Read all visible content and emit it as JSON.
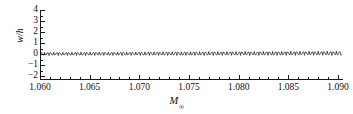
{
  "chart_data": {
    "type": "line",
    "title": "",
    "subtitle": "",
    "xlabel": "M",
    "xlabel_subscript": "∞",
    "ylabel": "w/h",
    "xlim": [
      1.06,
      1.0905
    ],
    "ylim": [
      -2.35,
      4.0
    ],
    "grid": false,
    "legend": null,
    "annotations": [],
    "xticks": [
      1.06,
      1.065,
      1.07,
      1.075,
      1.08,
      1.085,
      1.09
    ],
    "xtick_labels": [
      "1.060",
      "1.065",
      "1.070",
      "1.075",
      "1.080",
      "1.085",
      "1.090"
    ],
    "xtick_minor_step": 0.001,
    "yticks": [
      -2,
      -1,
      0,
      1,
      2,
      3,
      4
    ],
    "ytick_labels": [
      "−2",
      "−1",
      "0",
      "1",
      "2",
      "3",
      "4"
    ],
    "line_color": "#1a1a1a",
    "line_width": 0.9,
    "background": "#ffffff",
    "series": [
      {
        "name": "w/h",
        "waveform": "triangular",
        "n_cycles": 33,
        "x_start": 1.06,
        "x_end": 1.0903,
        "period": 0.000918,
        "amplitude_start": 1.88,
        "amplitude_end": 2.42,
        "offset_start": 0.02,
        "offset_end": 0.08,
        "peak_sharpness": 0.46,
        "x": [
          1.06,
          1.065,
          1.07,
          1.075,
          1.08,
          1.085,
          1.09
        ],
        "peak_envelope": [
          1.9,
          1.98,
          2.06,
          2.14,
          2.22,
          2.32,
          2.42
        ],
        "trough_envelope": [
          -1.96,
          -1.98,
          -2.0,
          -2.02,
          -2.04,
          -2.06,
          -2.08
        ]
      }
    ]
  },
  "figure": {
    "ylabel_text": "w/h",
    "xlabel_text": "M"
  }
}
